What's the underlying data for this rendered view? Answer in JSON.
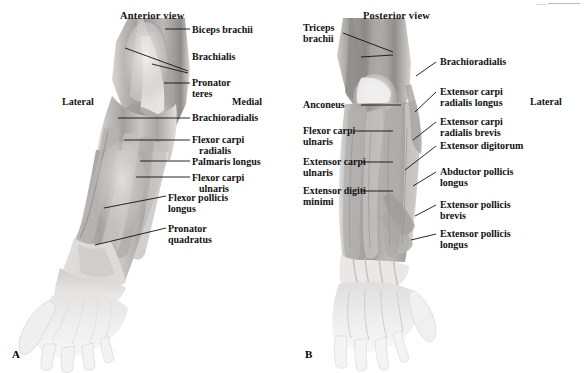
{
  "figure": {
    "type": "anatomical-illustration",
    "panels": [
      {
        "letter": "A",
        "view_title": "Anterior view",
        "orientation_left": "Lateral",
        "orientation_right": "Medial",
        "labels": [
          {
            "id": "biceps-brachii",
            "line1": "Biceps brachii",
            "line2": ""
          },
          {
            "id": "brachialis",
            "line1": "Brachialis",
            "line2": ""
          },
          {
            "id": "pronator-teres",
            "line1": "Pronator",
            "line2": "teres"
          },
          {
            "id": "brachioradialis",
            "line1": "Brachioradialis",
            "line2": ""
          },
          {
            "id": "flexor-carpi-radialis",
            "line1": "Flexor carpi",
            "line2": "radialis"
          },
          {
            "id": "palmaris-longus",
            "line1": "Palmaris longus",
            "line2": ""
          },
          {
            "id": "flexor-carpi-ulnaris",
            "line1": "Flexor carpi",
            "line2": "ulnaris"
          },
          {
            "id": "flexor-pollicis-longus",
            "line1": "Flexor pollicis",
            "line2": "longus"
          },
          {
            "id": "pronator-quadratus",
            "line1": "Pronator",
            "line2": "quadratus"
          }
        ]
      },
      {
        "letter": "B",
        "view_title": "Posterior view",
        "orientation_left": "",
        "orientation_right": "Lateral",
        "labels_left": [
          {
            "id": "triceps-brachii",
            "line1": "Triceps",
            "line2": "brachii"
          },
          {
            "id": "anconeus",
            "line1": "Anconeus",
            "line2": ""
          },
          {
            "id": "flexor-carpi-ulnaris-b",
            "line1": "Flexor carpi",
            "line2": "ulnaris"
          },
          {
            "id": "extensor-carpi-ulnaris",
            "line1": "Extensor carpi",
            "line2": "ulnaris"
          },
          {
            "id": "extensor-digiti-minimi",
            "line1": "Extensor digiti",
            "line2": "minimi"
          }
        ],
        "labels_right": [
          {
            "id": "brachioradialis-b",
            "line1": "Brachioradialis",
            "line2": ""
          },
          {
            "id": "extensor-carpi-radialis-longus",
            "line1": "Extensor carpi",
            "line2": "radialis longus"
          },
          {
            "id": "extensor-carpi-radialis-brevis",
            "line1": "Extensor carpi",
            "line2": "radialis brevis"
          },
          {
            "id": "extensor-digitorum",
            "line1": "Extensor digitorum",
            "line2": ""
          },
          {
            "id": "abductor-pollicis-longus",
            "line1": "Abductor pollicis",
            "line2": "longus"
          },
          {
            "id": "extensor-pollicis-brevis",
            "line1": "Extensor pollicis",
            "line2": "brevis"
          },
          {
            "id": "extensor-pollicis-longus",
            "line1": "Extensor pollicis",
            "line2": "longus"
          }
        ]
      }
    ]
  },
  "colors": {
    "text": "#121212",
    "leader": "#111111",
    "background": "#ffffff",
    "muscle_light": "#e6e4e2",
    "muscle_mid": "#b9b6b4",
    "muscle_dark": "#8e8a88",
    "muscle_shadow": "#6e6a68",
    "hand_light": "#efeeed"
  }
}
